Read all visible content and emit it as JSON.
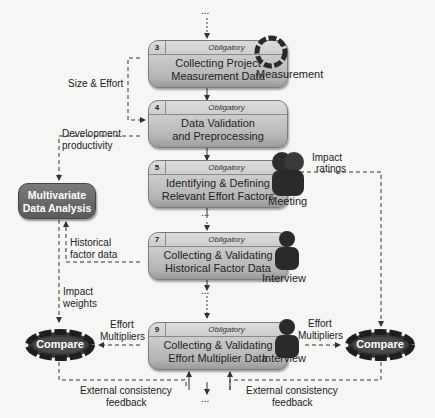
{
  "steps": [
    {
      "num": "3",
      "tag": "Obligatory",
      "line1": "Collecting Project",
      "line2": "Measurement Data",
      "actor": "Measurement"
    },
    {
      "num": "4",
      "tag": "Obligatory",
      "line1": "Data Validation",
      "line2": "and Preprocessing"
    },
    {
      "num": "5",
      "tag": "Obligatory",
      "line1": "Identifying & Defining",
      "line2": "Relevant Effort Factors",
      "actor": "Meeting"
    },
    {
      "num": "7",
      "tag": "Obligatory",
      "line1": "Collecting & Validating",
      "line2": "Historical Factor Data",
      "actor": "Interview"
    },
    {
      "num": "9",
      "tag": "Obligatory",
      "line1": "Collecting & Validating",
      "line2": "Effort Multiplier Data",
      "actor": "Interview"
    }
  ],
  "analysis": {
    "line1": "Multivariate",
    "line2": "Data Analysis"
  },
  "compare": {
    "left": "Compare",
    "right": "Compare"
  },
  "flows": {
    "size_effort": "Size & Effort",
    "dev_prod_1": "Development",
    "dev_prod_2": "productivity",
    "impact_ratings_1": "Impact",
    "impact_ratings_2": "ratings",
    "hist_factor_1": "Historical",
    "hist_factor_2": "factor data",
    "impact_weights_1": "Impact",
    "impact_weights_2": "weights",
    "effort_mult_left_1": "Effort",
    "effort_mult_left_2": "Multipliers",
    "effort_mult_right_1": "Effort",
    "effort_mult_right_2": "Multipliers",
    "ext_left_1": "External consistency",
    "ext_left_2": "feedback",
    "ext_right_1": "External consistency",
    "ext_right_2": "feedback"
  },
  "ellipsis": "..."
}
